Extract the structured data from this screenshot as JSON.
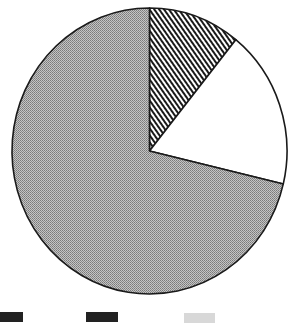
{
  "chart_data": {
    "type": "pie",
    "title": "",
    "start_angle_deg": 0,
    "direction": "clockwise",
    "slices": [
      {
        "label": "",
        "value": 10.8,
        "fill": "hatch-diagonal"
      },
      {
        "label": "",
        "value": 17.9,
        "fill": "white"
      },
      {
        "label": "",
        "value": 71.3,
        "fill": "gray-stipple"
      }
    ],
    "legend": {
      "position": "bottom",
      "entries": [
        {
          "fill": "dark",
          "label": ""
        },
        {
          "fill": "dark",
          "label": ""
        },
        {
          "fill": "light-gray",
          "label": ""
        }
      ]
    }
  },
  "colors": {
    "outline": "#1a1a1a",
    "gray": "#a8a8a8",
    "hatch_line": "#1a1a1a",
    "white": "#ffffff",
    "legend_dark": "#222222",
    "legend_light": "#d8d8d8"
  }
}
